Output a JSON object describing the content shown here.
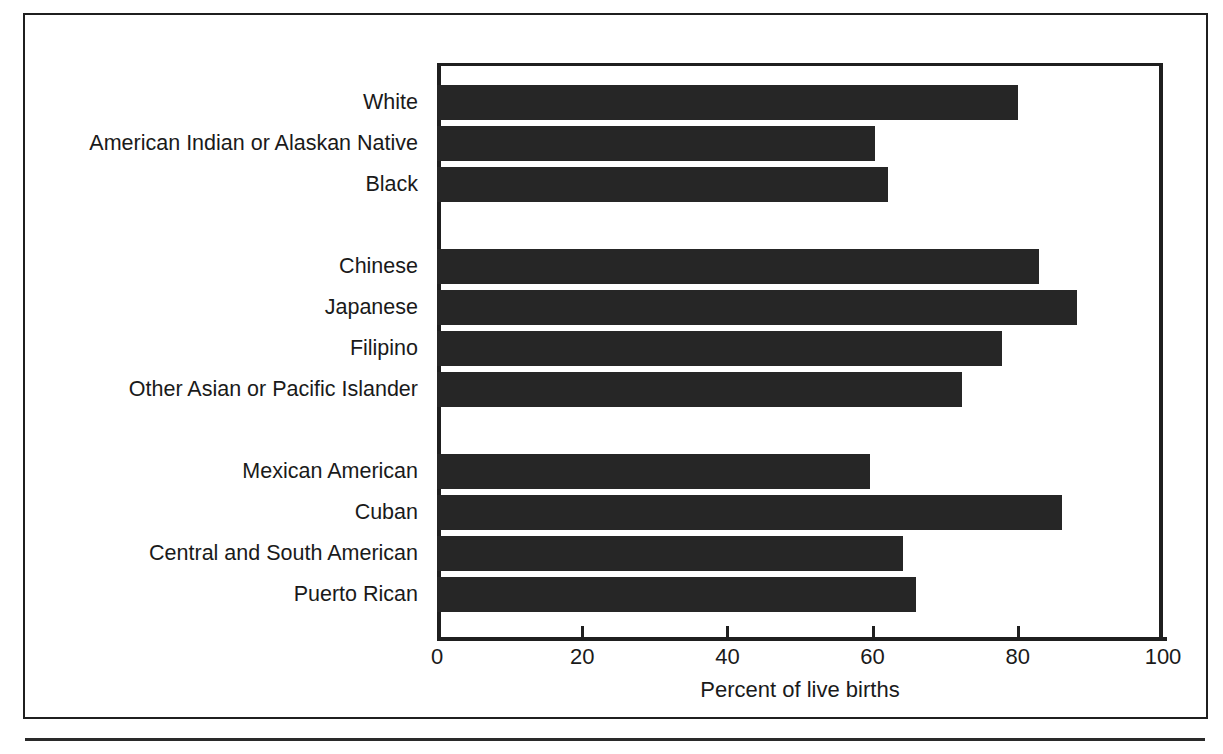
{
  "chart_data": {
    "type": "bar",
    "orientation": "horizontal",
    "title": "",
    "xlabel": "Percent of live births",
    "ylabel": "",
    "xlim": [
      0,
      100
    ],
    "xticks": [
      0,
      20,
      40,
      60,
      80,
      100
    ],
    "xtick_labels": [
      "0",
      "20",
      "40",
      "60",
      "80",
      "100"
    ],
    "grid": false,
    "legend": null,
    "bar_color": "#262626",
    "groups": [
      {
        "name": "race",
        "categories": [
          "White",
          "American Indian or Alaskan Native",
          "Black"
        ],
        "values": [
          80.0,
          60.3,
          62.1
        ]
      },
      {
        "name": "asian-pacific-islander",
        "categories": [
          "Chinese",
          "Japanese",
          "Filipino",
          "Other Asian or Pacific Islander"
        ],
        "values": [
          82.9,
          88.2,
          77.8,
          72.3
        ]
      },
      {
        "name": "hispanic-origin",
        "categories": [
          "Mexican American",
          "Cuban",
          "Central and South American",
          "Puerto Rican"
        ],
        "values": [
          59.6,
          86.1,
          64.2,
          66.0
        ]
      }
    ],
    "categories": [
      "White",
      "American Indian or Alaskan Native",
      "Black",
      "Chinese",
      "Japanese",
      "Filipino",
      "Other Asian or Pacific Islander",
      "Mexican American",
      "Cuban",
      "Central and South American",
      "Puerto Rican"
    ],
    "values": [
      80.0,
      60.3,
      62.1,
      82.9,
      88.2,
      77.8,
      72.3,
      59.6,
      86.1,
      64.2,
      66.0
    ]
  },
  "axis": {
    "x_label": "Percent of live births",
    "ticks": [
      {
        "value": 0,
        "label": "0"
      },
      {
        "value": 20,
        "label": "20"
      },
      {
        "value": 40,
        "label": "40"
      },
      {
        "value": 60,
        "label": "60"
      },
      {
        "value": 80,
        "label": "80"
      },
      {
        "value": 100,
        "label": "100"
      }
    ]
  },
  "rows": [
    {
      "label": "White",
      "value": 80.0,
      "slot": 0
    },
    {
      "label": "American Indian or Alaskan Native",
      "value": 60.3,
      "slot": 1
    },
    {
      "label": "Black",
      "value": 62.1,
      "slot": 2
    },
    {
      "label": "Chinese",
      "value": 82.9,
      "slot": 4
    },
    {
      "label": "Japanese",
      "value": 88.2,
      "slot": 5
    },
    {
      "label": "Filipino",
      "value": 77.8,
      "slot": 6
    },
    {
      "label": "Other Asian or Pacific Islander",
      "value": 72.3,
      "slot": 7
    },
    {
      "label": "Mexican American",
      "value": 59.6,
      "slot": 9
    },
    {
      "label": "Cuban",
      "value": 86.1,
      "slot": 10
    },
    {
      "label": "Central and South American",
      "value": 64.2,
      "slot": 11
    },
    {
      "label": "Puerto Rican",
      "value": 66.0,
      "slot": 12
    }
  ]
}
